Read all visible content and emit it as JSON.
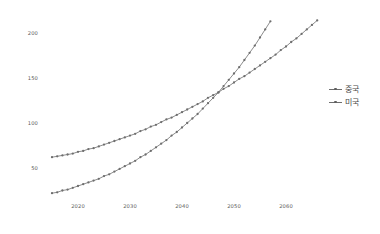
{
  "chart_data": {
    "type": "line",
    "title": "",
    "xlabel": "",
    "ylabel": "",
    "xlim": [
      2015,
      2067
    ],
    "ylim": [
      10,
      228
    ],
    "grid": false,
    "legend_position": "right",
    "xticks": [
      2020,
      2030,
      2040,
      2050,
      2060
    ],
    "xticklabels": [
      "2020",
      "2030",
      "2040",
      "2050",
      "2060"
    ],
    "yticks": [
      50,
      100,
      150,
      200
    ],
    "yticklabels": [
      "50",
      "100",
      "150",
      "200"
    ],
    "marker": "dot",
    "x": [
      2015,
      2016,
      2017,
      2018,
      2019,
      2020,
      2021,
      2022,
      2023,
      2024,
      2025,
      2026,
      2027,
      2028,
      2029,
      2030,
      2031,
      2032,
      2033,
      2034,
      2035,
      2036,
      2037,
      2038,
      2039,
      2040,
      2041,
      2042,
      2043,
      2044,
      2045,
      2046,
      2047,
      2048,
      2049,
      2050,
      2051,
      2052,
      2053,
      2054,
      2055,
      2056,
      2057,
      2058,
      2059,
      2060,
      2061,
      2062,
      2063,
      2064,
      2065,
      2066,
      2067
    ],
    "series": [
      {
        "name": "중국",
        "color": "#6e6e6e",
        "values": [
          22,
          23,
          25,
          26,
          28,
          30,
          32,
          34,
          36,
          38,
          41,
          43,
          46,
          49,
          52,
          55,
          58,
          62,
          65,
          69,
          73,
          77,
          81,
          86,
          90,
          95,
          100,
          105,
          110,
          116,
          122,
          128,
          134,
          141,
          148,
          155,
          162,
          170,
          178,
          186,
          195,
          204,
          213,
          223,
          233,
          244,
          255,
          267,
          279,
          292,
          305,
          319,
          334
        ]
      },
      {
        "name": "미국",
        "color": "#6e6e6e",
        "values": [
          62,
          63,
          64,
          65,
          66,
          68,
          69,
          71,
          72,
          74,
          76,
          78,
          80,
          82,
          84,
          86,
          88,
          91,
          93,
          96,
          98,
          101,
          104,
          106,
          109,
          112,
          115,
          118,
          121,
          124,
          128,
          131,
          134,
          138,
          141,
          145,
          149,
          152,
          156,
          160,
          164,
          168,
          172,
          176,
          181,
          185,
          190,
          194,
          199,
          204,
          209,
          214,
          219
        ]
      }
    ]
  },
  "legend": {
    "items": [
      {
        "label": "중국"
      },
      {
        "label": "미국"
      }
    ]
  }
}
